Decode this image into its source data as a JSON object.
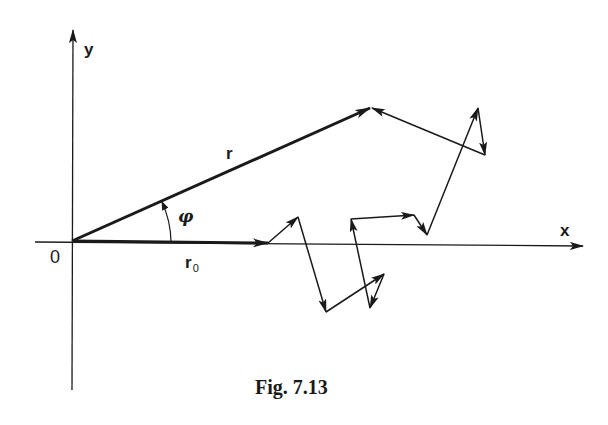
{
  "figure": {
    "caption": "Fig. 7.13",
    "labels": {
      "y_axis": "y",
      "x_axis": "x",
      "origin": "0",
      "resultant_vector": "r",
      "angle": "φ",
      "initial_vector_base": "r",
      "initial_vector_subscript": "0"
    },
    "colors": {
      "ink": "#1a1a1a",
      "background": "#ffffff"
    }
  },
  "diagram_data": {
    "description": "2D random walk: resultant vector r from origin at angle phi to x-axis, initial step r0 along x-axis, followed by chain of step vectors ending at tip of r",
    "origin_px": [
      72,
      241
    ],
    "axes": {
      "x_axis": {
        "from": [
          35,
          242
        ],
        "to": [
          583,
          246
        ]
      },
      "y_axis": {
        "from": [
          72,
          390
        ],
        "to": [
          73,
          28
        ]
      }
    },
    "vectors": {
      "r": {
        "from": [
          72,
          241
        ],
        "to": [
          371,
          108
        ],
        "bold": true
      },
      "r0": {
        "from": [
          72,
          241
        ],
        "to": [
          268,
          243
        ],
        "bold": true
      }
    },
    "walk_vertices": [
      [
        268,
        243
      ],
      [
        298,
        217
      ],
      [
        326,
        312
      ],
      [
        384,
        274
      ],
      [
        370,
        308
      ],
      [
        351,
        219
      ],
      [
        414,
        215
      ],
      [
        427,
        235
      ],
      [
        478,
        108
      ],
      [
        485,
        155
      ],
      [
        371,
        108
      ]
    ]
  }
}
